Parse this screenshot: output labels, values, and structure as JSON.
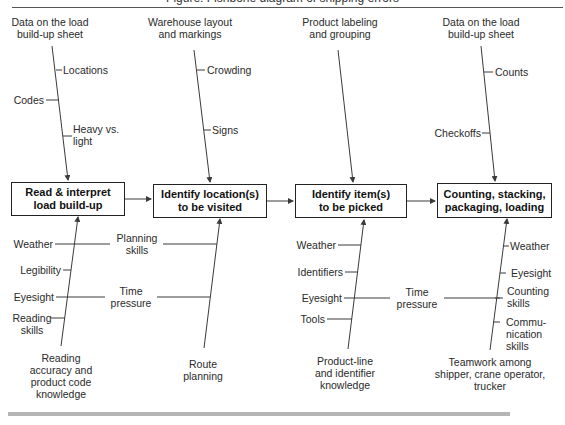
{
  "figure": {
    "title_clipped": "Figure: Fishbone diagram of shipping errors"
  },
  "process_steps": [
    {
      "label": "Read & interpret\nload build-up"
    },
    {
      "label": "Identify location(s)\nto be visited"
    },
    {
      "label": "Identify item(s)\nto be picked"
    },
    {
      "label": "Counting, stacking,\npackaging, loading"
    }
  ],
  "top_causes": [
    {
      "main": "Data on the load\nbuild-up sheet",
      "subs": [
        "Locations",
        "Codes",
        "Heavy vs.\nlight"
      ]
    },
    {
      "main": "Warehouse layout\nand markings",
      "subs": [
        "Crowding",
        "Signs"
      ]
    },
    {
      "main": "Product labeling\nand grouping",
      "subs": []
    },
    {
      "main": "Data on the load\nbuild-up sheet",
      "subs": [
        "Counts",
        "Checkoffs"
      ]
    }
  ],
  "bottom_causes": [
    {
      "main": "Reading\naccuracy and\nproduct code\nknowledge",
      "subs": [
        "Weather",
        "Legibility",
        "Eyesight",
        "Reading\nskills"
      ]
    },
    {
      "main": "Route\nplanning",
      "subs": []
    },
    {
      "main": "Product-line\nand identifier\nknowledge",
      "subs": [
        "Weather",
        "Identifiers",
        "Eyesight",
        "Tools"
      ]
    },
    {
      "main": "Teamwork among\nshipper, crane operator,\ntrucker",
      "subs": [
        "Weather",
        "Eyesight",
        "Counting\nskills",
        "Commu-\nnication\nskills"
      ]
    }
  ],
  "shared_causes": [
    {
      "label": "Planning\nskills"
    },
    {
      "label": "Time\npressure"
    },
    {
      "label": "Time\npressure"
    }
  ],
  "colors": {
    "line": "#3a3a3a",
    "box_border": "#222222",
    "bottom_bar": "#b5b5b5"
  }
}
